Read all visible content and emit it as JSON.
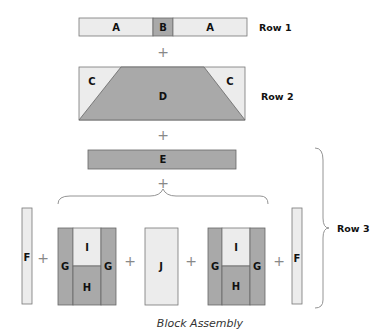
{
  "colors": {
    "light_fabric": "#ececec",
    "dark_fabric": "#a9a9a9",
    "outline": "#777777"
  },
  "rows": {
    "row1": {
      "label": "Row 1",
      "pieces": [
        "A",
        "B",
        "A"
      ]
    },
    "row2": {
      "label": "Row 2",
      "pieces": [
        "C",
        "D",
        "C"
      ]
    },
    "row3": {
      "label": "Row 3",
      "top_piece": "E",
      "units": [
        "F",
        "G",
        "I",
        "H",
        "G",
        "J",
        "G",
        "I",
        "H",
        "G",
        "F"
      ]
    }
  },
  "plus_symbol": "+",
  "caption": "Block Assembly"
}
